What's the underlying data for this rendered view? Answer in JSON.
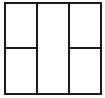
{
  "diagram": {
    "type": "panel-layout",
    "line_color": "#1a1a1a",
    "background": "#ffffff",
    "columns": 3,
    "panels": [
      {
        "id": "left-top"
      },
      {
        "id": "left-bottom"
      },
      {
        "id": "center-full"
      },
      {
        "id": "right-top"
      },
      {
        "id": "right-bottom"
      }
    ]
  }
}
